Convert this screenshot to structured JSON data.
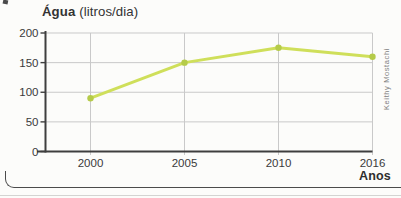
{
  "chart_data": {
    "type": "line",
    "title": "Água (litros/dia)",
    "title_bold": "Água",
    "title_unit": " (litros/dia)",
    "xlabel": "Anos",
    "ylabel": "",
    "categories": [
      "2000",
      "2005",
      "2010",
      "2016"
    ],
    "values": [
      90,
      150,
      175,
      160
    ],
    "y_ticks": [
      0,
      50,
      100,
      150,
      200
    ],
    "ylim": [
      0,
      200
    ],
    "grid": true,
    "legend": "none",
    "credit": "Keithy Mostachi",
    "colors": {
      "line": "#cfdf5a",
      "point": "#b5cb49",
      "grid": "#c9c9c9",
      "axis": "#3e3e3e",
      "text": "#3a3a3a"
    }
  }
}
